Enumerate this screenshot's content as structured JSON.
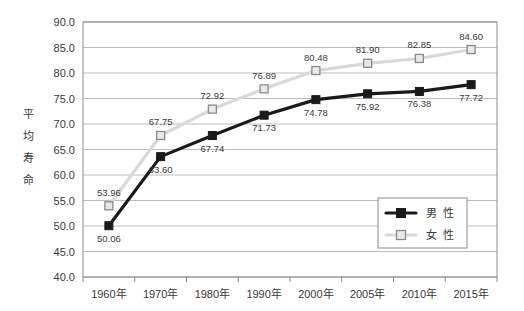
{
  "chart_data": {
    "type": "line",
    "title": "",
    "xlabel": "",
    "ylabel": "平均寿命",
    "ylim": [
      40.0,
      90.0
    ],
    "ytick_step": 5.0,
    "grid": true,
    "legend_position": "inside-bottom-right",
    "categories": [
      "1960年",
      "1970年",
      "1980年",
      "1990年",
      "2000年",
      "2005年",
      "2010年",
      "2015年"
    ],
    "ytick_labels": [
      "40.0",
      "45.0",
      "50.0",
      "55.0",
      "60.0",
      "65.0",
      "70.0",
      "75.0",
      "80.0",
      "85.0",
      "90.0"
    ],
    "series": [
      {
        "name": "男性",
        "color": "#1a1a1a",
        "marker": "filled-square",
        "values": [
          50.06,
          63.6,
          67.74,
          71.73,
          74.78,
          75.92,
          76.38,
          77.72
        ],
        "labels": [
          "50.06",
          "63.60",
          "67.74",
          "71.73",
          "74.78",
          "75.92",
          "76.38",
          "77.72"
        ],
        "label_position": "below"
      },
      {
        "name": "女性",
        "color": "#d9d9d9",
        "marker": "hollow-square",
        "values": [
          53.96,
          67.75,
          72.92,
          76.89,
          80.48,
          81.9,
          82.85,
          84.6
        ],
        "labels": [
          "53.96",
          "67.75",
          "72.92",
          "76.89",
          "80.48",
          "81.90",
          "82.85",
          "84.60"
        ],
        "label_position": "above"
      }
    ]
  },
  "legend": {
    "items": [
      {
        "label": "男 性",
        "series": "男性"
      },
      {
        "label": "女 性",
        "series": "女性"
      }
    ]
  },
  "axis": {
    "y_title_chars": [
      "平",
      "均",
      "寿",
      "命"
    ]
  },
  "colors": {
    "male_line": "#1a1a1a",
    "female_line": "#d9d9d9",
    "female_marker_fill": "#e8e8e8",
    "female_marker_stroke": "#8a8a8a",
    "grid": "#b5b5b5",
    "frame": "#8a8a8a",
    "text": "#3a3a3a",
    "background": "#ffffff"
  }
}
